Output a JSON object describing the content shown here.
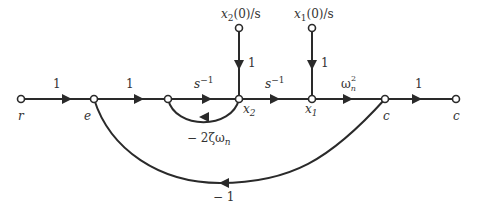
{
  "diagram": {
    "type": "signal-flow-graph",
    "nodes": [
      {
        "id": "r",
        "label": "r",
        "x": 21,
        "y": 99
      },
      {
        "id": "e",
        "label": "e",
        "x": 94,
        "y": 99
      },
      {
        "id": "n3",
        "label": "",
        "x": 168,
        "y": 99
      },
      {
        "id": "x2",
        "label": "x",
        "sub": "2",
        "x": 239,
        "y": 99
      },
      {
        "id": "x1",
        "label": "x",
        "sub": "1",
        "x": 312,
        "y": 99
      },
      {
        "id": "c",
        "label": "c",
        "x": 385,
        "y": 99
      },
      {
        "id": "cout",
        "label": "c",
        "x": 456,
        "y": 99
      },
      {
        "id": "x2init",
        "label": "x₂(0)/s",
        "x": 239,
        "y": 28
      },
      {
        "id": "x1init",
        "label": "x₁(0)/s",
        "x": 312,
        "y": 28
      }
    ],
    "edges": [
      {
        "from": "r",
        "to": "e",
        "gain": "1"
      },
      {
        "from": "e",
        "to": "n3",
        "gain": "1"
      },
      {
        "from": "n3",
        "to": "x2",
        "gain": "s⁻¹"
      },
      {
        "from": "x2",
        "to": "x1",
        "gain": "s⁻¹"
      },
      {
        "from": "x1",
        "to": "c",
        "gain": "ωn²"
      },
      {
        "from": "c",
        "to": "cout",
        "gain": "1"
      },
      {
        "from": "x2init",
        "to": "x2",
        "gain": "1"
      },
      {
        "from": "x1init",
        "to": "x1",
        "gain": "1"
      },
      {
        "from": "x2",
        "to": "n3",
        "gain": "− 2ζωn"
      },
      {
        "from": "c",
        "to": "e",
        "gain": "− 1"
      }
    ]
  },
  "labels": {
    "r": "r",
    "e": "e",
    "x2_main": "x",
    "x2_sub": "2",
    "x1_main": "x",
    "x1_sub": "1",
    "c": "c",
    "cout": "c",
    "x2init_x": "x",
    "x2init_sub": "2",
    "x2init_rest": "(0)/s",
    "x1init_x": "x",
    "x1init_sub": "1",
    "x1init_rest": "(0)/s",
    "gain_r_e": "1",
    "gain_e_n3": "1",
    "gain_n3_x2_base": "s",
    "gain_n3_x2_exp": "−1",
    "gain_x2_x1_base": "s",
    "gain_x2_x1_exp": "−1",
    "gain_x1_c_base": "ω",
    "gain_x1_c_sub": "n",
    "gain_x1_c_sup": "2",
    "gain_c_out": "1",
    "gain_x2init": "1",
    "gain_x1init": "1",
    "gain_inner_loop_prefix": "− 2ζω",
    "gain_inner_loop_sub": "n",
    "gain_outer_loop": "− 1"
  }
}
